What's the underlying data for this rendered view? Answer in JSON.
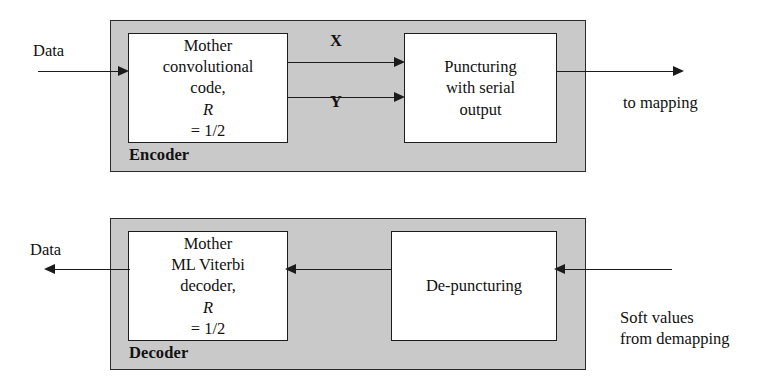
{
  "diagram": {
    "colors": {
      "panel_fill": "#c9c9c9",
      "block_fill": "#ffffff",
      "stroke": "#1b1b1b",
      "background": "#ffffff"
    }
  },
  "encoder": {
    "caption": "Encoder",
    "input_label": "Data",
    "output_label": "to mapping",
    "signal_x": "X",
    "signal_y": "Y",
    "blocks": [
      {
        "name": "mother-convolutional-code",
        "lines": [
          "Mother",
          "convolutional",
          "code, R = 1/2"
        ],
        "line1": "Mother",
        "line2": "convolutional",
        "line3_prefix": "code, ",
        "line3_italic": "R",
        "line3_suffix": " = 1/2"
      },
      {
        "name": "puncturing-with-serial-output",
        "lines": [
          "Puncturing",
          "with serial",
          "output"
        ],
        "line1": "Puncturing",
        "line2": "with serial",
        "line3": "output"
      }
    ]
  },
  "decoder": {
    "caption": "Decoder",
    "output_label": "Data",
    "input_label_line1": "Soft values",
    "input_label_line2": "from demapping",
    "blocks": [
      {
        "name": "mother-ml-viterbi-decoder",
        "lines": [
          "Mother",
          "ML Viterbi",
          "decoder, R = 1/2"
        ],
        "line1": "Mother",
        "line2": "ML Viterbi",
        "line3_prefix": "decoder, ",
        "line3_italic": "R",
        "line3_suffix": " = 1/2"
      },
      {
        "name": "de-puncturing",
        "lines": [
          "De-puncturing"
        ],
        "line1": "De-puncturing"
      }
    ]
  }
}
